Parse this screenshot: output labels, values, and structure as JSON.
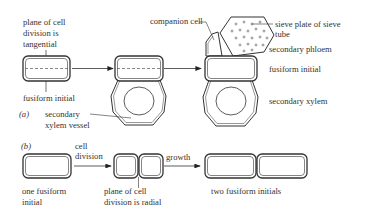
{
  "part_a": {
    "label": "(a)",
    "labels": {
      "plane_tangential": [
        "plane of cell",
        "division is",
        "tangential"
      ],
      "fusiform_initial_left": "fusiform initial",
      "secondary_xylem_vessel": [
        "secondary",
        "xylem vessel"
      ],
      "companion_cell": "companion cell",
      "sieve_plate": [
        "sieve plate of sieve",
        "tube"
      ],
      "secondary_phloem": "secondary phloem",
      "fusiform_initial_right": "fusiform initial",
      "secondary_xylem": "secondary xylem"
    }
  },
  "part_b": {
    "label": "(b)",
    "labels": {
      "cell_division": [
        "cell",
        "division"
      ],
      "growth": "growth",
      "one_fusiform_initial": [
        "one fusiform",
        "initial"
      ],
      "plane_radial": [
        "plane of cell",
        "division is radial"
      ],
      "two_fusiform_initials": "two fusiform initials"
    }
  },
  "colors": {
    "stroke": "#333333",
    "text": "#333333",
    "background": "#ffffff"
  }
}
